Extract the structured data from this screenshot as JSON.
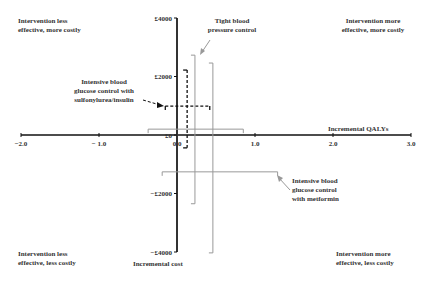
{
  "chart_data": {
    "type": "scatter",
    "title": "",
    "xlabel": "Incremental QALYs",
    "ylabel": "Incremental cost",
    "xlim": [
      -2.0,
      3.0
    ],
    "ylim": [
      -4000,
      4000
    ],
    "x_ticks": [
      -2.0,
      -1.0,
      0.0,
      1.0,
      2.0,
      3.0
    ],
    "x_tick_labels": [
      "−2.0",
      "− 1.0",
      "0.0",
      "1.0",
      "2.0",
      "3.0"
    ],
    "y_ticks": [
      4000,
      2000,
      0,
      -2000,
      -4000
    ],
    "y_tick_labels": [
      "£4000",
      "£2000",
      "£0",
      "−£2000",
      "−£4000"
    ],
    "grid": false,
    "quadrant_labels": {
      "top_left": [
        "Intervention less",
        "effective, more costly"
      ],
      "top_right": [
        "Intervention more",
        "effective, more costly"
      ],
      "bottom_left": [
        "Intervention less",
        "effective, less costly"
      ],
      "bottom_right": [
        "Intervention more",
        "effective, less costly"
      ]
    },
    "series": [
      {
        "name": "Intensive blood glucose control with sulfonylurea/insulin",
        "label_lines": [
          "Intensive blood",
          "glucose control with",
          "sulfonylurea/insulin"
        ],
        "style": "dashed",
        "color": "#111111",
        "point": {
          "qaly": 0.13,
          "cost": 990
        },
        "qaly_ci": [
          -0.15,
          0.42
        ],
        "cost_ci": [
          -440,
          2220
        ]
      },
      {
        "name": "Tight blood pressure control",
        "label_lines": [
          "Tight blood",
          "pressure control"
        ],
        "style": "solid",
        "color": "#999999",
        "point": {
          "qaly": 0.23,
          "cost": 200
        },
        "qaly_ci": [
          -0.37,
          0.85
        ],
        "cost_ci": [
          -2350,
          2730
        ]
      },
      {
        "name": "Intensive blood glucose control with metformin",
        "label_lines": [
          "Intensive blood",
          "glucose control",
          "with metformin"
        ],
        "style": "solid",
        "color": "#999999",
        "point": {
          "qaly": 0.46,
          "cost": -1260
        },
        "qaly_ci": [
          -0.19,
          1.29
        ],
        "cost_ci": [
          -4030,
          2460
        ]
      }
    ]
  }
}
